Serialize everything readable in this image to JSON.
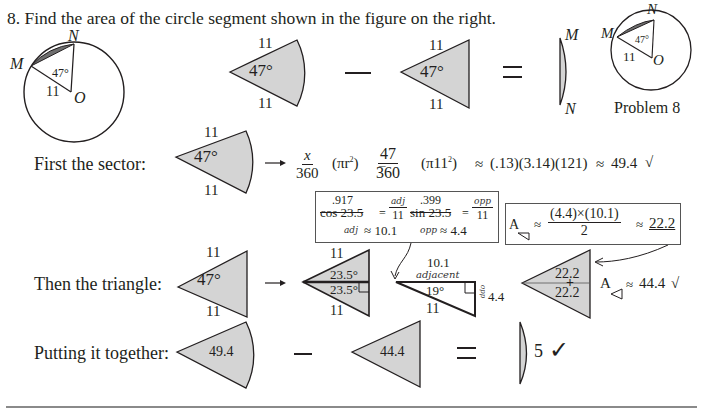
{
  "problem": {
    "title": "8. Find the area of the circle segment shown in the figure on the right.",
    "figure_caption": "Problem 8",
    "points": {
      "M": "M",
      "N": "N",
      "O": "O"
    },
    "angle": "47°",
    "radius": "11"
  },
  "colors": {
    "fill": "#d4d4d4",
    "segment_fill": "#6e6e6e",
    "stroke": "#231f20",
    "ink": "#231f20"
  },
  "overview": {
    "sector_side_top": "11",
    "sector_side_bottom": "11",
    "sector_angle": "47°",
    "minus": "−",
    "triangle_side_top": "11",
    "triangle_side_bottom": "11",
    "triangle_angle": "47°",
    "equals": "=",
    "segment_top": "M",
    "segment_bottom": "N"
  },
  "sector_step": {
    "label": "First the sector:",
    "side_top": "11",
    "side_bottom": "11",
    "angle": "47°",
    "arrow": "→",
    "frac1_num": "x",
    "frac1_den": "360",
    "pi_r2": "(πr",
    "pi_r2_exp": "2",
    "pi_r2_close": ")",
    "eq": "=",
    "frac2_num": "47",
    "frac2_den": "360",
    "pi11": "(π11",
    "pi11_exp": "2",
    "pi11_close": ")",
    "approx1": "≈",
    "product": "(.13)(3.14)(121)",
    "approx2": "≈",
    "result": "49.4",
    "check": "√"
  },
  "trig_box": {
    "cos_value": ".917",
    "cos_expr": "cos 23.5",
    "eq1": "=",
    "adj_num": "adj",
    "adj_den": "11",
    "sin_value": ".399",
    "sin_expr": "sin 23.5",
    "eq2": "=",
    "opp_num": "opp",
    "opp_den": "11",
    "adj_label": "adj",
    "adj_result": "≈ 10.1",
    "opp_label": "opp",
    "opp_result": "≈ 4.4"
  },
  "area_box": {
    "A": "A",
    "approx1": "≈",
    "num": "(4.4)×(10.1)",
    "den": "2",
    "approx2": "≈",
    "result": "22.2"
  },
  "triangle_step": {
    "label": "Then the triangle:",
    "side_top": "11",
    "side_bottom": "11",
    "angle": "47°",
    "arrow": "→",
    "split_top_side": "11",
    "split_bottom_side": "11",
    "split_angle_top": "23.5°",
    "split_angle_bottom": "23.5°",
    "right_tri_top": "10.1",
    "right_tri_adj_label": "adjacent",
    "right_tri_angle": "19°",
    "right_tri_hyp": "11",
    "right_tri_opp_label": "opp",
    "right_tri_opp": "4.4",
    "half_area_top": "22.2",
    "half_area_bottom": "22.2",
    "plus": "+",
    "A": "A",
    "approx": "≈",
    "total": "44.4",
    "check": "√"
  },
  "together_step": {
    "label": "Putting it together:",
    "sector_value": "49.4",
    "minus": "−",
    "triangle_value": "44.4",
    "equals": "=",
    "segment_value": "5",
    "check": "✓"
  }
}
